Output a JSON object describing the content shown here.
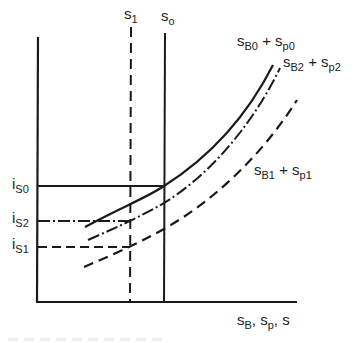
{
  "diagram": {
    "type": "economic-diagram",
    "colors": {
      "ink": "#1a1a1a",
      "background": "#ffffff"
    },
    "axes": {
      "x_label": {
        "main": "s",
        "sub1": "B",
        "sep1": ", s",
        "sub2": "p",
        "sep2": ", s"
      },
      "y_label": ""
    },
    "vertical_lines": [
      {
        "id": "s1",
        "label_main": "s",
        "label_sub": "1",
        "style": "dashed"
      },
      {
        "id": "s0",
        "label_main": "s",
        "label_sub": "o",
        "style": "solid"
      }
    ],
    "horizontal_levels": [
      {
        "id": "iS0",
        "label_main": "i",
        "label_sub": "S0",
        "style": "solid"
      },
      {
        "id": "iS2",
        "label_main": "i",
        "label_sub": "S2",
        "style": "dash-dot"
      },
      {
        "id": "iS1",
        "label_main": "i",
        "label_sub": "S1",
        "style": "dashed"
      }
    ],
    "curves": [
      {
        "id": "sB0_sp0",
        "style": "solid",
        "label": {
          "a": "s",
          "a_sub": "B0",
          "plus": " + ",
          "b": "s",
          "b_sub": "p0"
        }
      },
      {
        "id": "sB2_sp2",
        "style": "dash-dot",
        "label": {
          "a": "s",
          "a_sub": "B2",
          "plus": " + ",
          "b": "s",
          "b_sub": "p2"
        }
      },
      {
        "id": "sB1_sp1",
        "style": "dashed",
        "label": {
          "a": "s",
          "a_sub": "B1",
          "plus": " + ",
          "b": "s",
          "b_sub": "p1"
        }
      }
    ]
  }
}
